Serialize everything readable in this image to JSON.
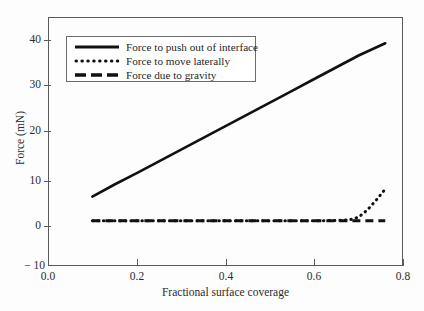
{
  "chart_data": {
    "type": "line",
    "title": "",
    "xlabel": "Fractional surface coverage",
    "ylabel": "Force (mN)",
    "xlim": [
      0.0,
      0.8
    ],
    "ylim": [
      -10,
      45
    ],
    "xticks": [
      "0.0",
      "0.2",
      "0.4",
      "0.6",
      "0.8"
    ],
    "xtick_values": [
      0.0,
      0.2,
      0.4,
      0.6,
      0.8
    ],
    "yticks": [
      "40",
      "30",
      "20",
      "10",
      "0",
      "− 10"
    ],
    "ytick_values": [
      40,
      30,
      20,
      10,
      0,
      -10
    ],
    "grid": false,
    "legend_position": "upper-left-inside",
    "series": [
      {
        "name": "Force to push out of interface",
        "style": "solid",
        "color": "#111111",
        "x": [
          0.1,
          0.15,
          0.2,
          0.25,
          0.3,
          0.35,
          0.4,
          0.45,
          0.5,
          0.55,
          0.6,
          0.65,
          0.7,
          0.76
        ],
        "values": [
          5.3,
          8.0,
          10.5,
          13.1,
          15.7,
          18.3,
          20.9,
          23.5,
          26.1,
          28.7,
          31.3,
          33.9,
          36.5,
          39.2
        ]
      },
      {
        "name": "Force to move laterally",
        "style": "dotted",
        "color": "#111111",
        "x": [
          0.1,
          0.2,
          0.3,
          0.4,
          0.5,
          0.6,
          0.65,
          0.68,
          0.7,
          0.72,
          0.74,
          0.76
        ],
        "values": [
          0.0,
          0.0,
          0.0,
          0.0,
          0.0,
          0.0,
          0.05,
          0.2,
          0.8,
          2.4,
          4.6,
          7.0
        ]
      },
      {
        "name": "Force due to gravity",
        "style": "dashed",
        "color": "#111111",
        "x": [
          0.1,
          0.76
        ],
        "values": [
          0.0,
          0.0
        ]
      }
    ]
  },
  "legend": {
    "entries": [
      {
        "label": "Force to push out of interface",
        "style": "solid"
      },
      {
        "label": "Force to move laterally",
        "style": "dotted"
      },
      {
        "label": "Force due to gravity",
        "style": "dashed"
      }
    ]
  },
  "axes": {
    "x_title": "Fractional surface coverage",
    "y_title": "Force (mN)",
    "x_labels": [
      "0.0",
      "0.2",
      "0.4",
      "0.6",
      "0.8"
    ],
    "y_labels": [
      "40",
      "30",
      "20",
      "10",
      "0",
      "− 10"
    ]
  }
}
